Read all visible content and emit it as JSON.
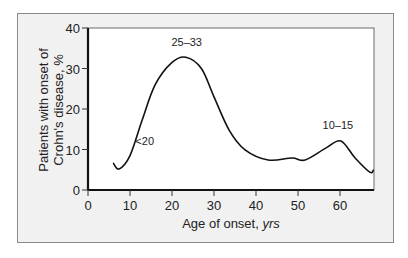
{
  "chart_data": {
    "type": "line",
    "title": "",
    "xlabel": "Age of onset, yrs",
    "xlabel_main": "Age of onset, ",
    "xlabel_unit": "yrs",
    "ylabel": "Patients with onset of Crohn's disease, %",
    "ylabel_line1": "Patients with onset of",
    "ylabel_line2": "Crohn's disease, %",
    "xlim": [
      0,
      68
    ],
    "ylim": [
      0,
      40
    ],
    "x_ticks": [
      0,
      10,
      20,
      30,
      40,
      50,
      60
    ],
    "y_ticks": [
      0,
      10,
      20,
      30,
      40
    ],
    "grid": false,
    "legend": null,
    "series": [
      {
        "name": "Onset distribution",
        "x": [
          6,
          7.4,
          10,
          12.9,
          16,
          20,
          23.3,
          27,
          30,
          33.6,
          37.4,
          42.9,
          48.6,
          51.7,
          56.7,
          60.2,
          63.6,
          67.1,
          68
        ],
        "y": [
          6.7,
          5.2,
          8.5,
          17.3,
          26,
          31.5,
          32.8,
          30,
          23,
          14.8,
          9.9,
          7.4,
          7.9,
          7.4,
          10.4,
          12.1,
          7.9,
          4.4,
          5.0
        ]
      }
    ],
    "annotations": [
      {
        "text": "25–33",
        "x": 23.5,
        "y": 35.5
      },
      {
        "text": "<20",
        "x": 13.5,
        "y": 11
      },
      {
        "text": "10–15",
        "x": 59.5,
        "y": 15
      }
    ]
  }
}
